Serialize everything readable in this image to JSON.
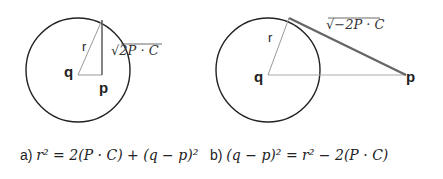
{
  "diagram_a": {
    "center_label": "q",
    "point_label": "p",
    "radius_label": "r",
    "segment_label": "√2P · C"
  },
  "diagram_b": {
    "center_label": "q",
    "point_label": "p",
    "radius_label": "r",
    "tangent_label": "√−2P · C"
  },
  "captions": {
    "a_prefix": "a)",
    "a_formula": "r² = 2(P · C) + (q − p)²",
    "b_prefix": "b)",
    "b_formula": "(q − p)² = r² − 2(P · C)"
  },
  "colors": {
    "circle": "#222222",
    "thin_line": "#999999",
    "tangent": "#666666"
  }
}
